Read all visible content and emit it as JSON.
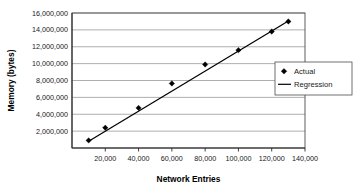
{
  "chart_data": {
    "type": "scatter",
    "title": "",
    "xlabel": "Network Entries",
    "ylabel": "Memory (bytes)",
    "xlim": [
      0,
      140000
    ],
    "ylim": [
      0,
      16000000
    ],
    "grid": true,
    "legend_position": "right-middle",
    "x_ticks": [
      {
        "value": 20000,
        "label": "20,000"
      },
      {
        "value": 40000,
        "label": "40,000"
      },
      {
        "value": 60000,
        "label": "60,000"
      },
      {
        "value": 80000,
        "label": "80,000"
      },
      {
        "value": 100000,
        "label": "100,000"
      },
      {
        "value": 120000,
        "label": "120,000"
      },
      {
        "value": 140000,
        "label": "140,000"
      }
    ],
    "y_ticks": [
      {
        "value": 2000000,
        "label": "2,000,000"
      },
      {
        "value": 4000000,
        "label": "4,000,000"
      },
      {
        "value": 6000000,
        "label": "6,000,000"
      },
      {
        "value": 8000000,
        "label": "8,000,000"
      },
      {
        "value": 10000000,
        "label": "10,000,000"
      },
      {
        "value": 12000000,
        "label": "12,000,000"
      },
      {
        "value": 14000000,
        "label": "14,000,000"
      },
      {
        "value": 16000000,
        "label": "16,000,000"
      }
    ],
    "series": [
      {
        "name": "Actual",
        "marker": "diamond",
        "style": "markers",
        "color": "#000000",
        "x": [
          10000,
          20000,
          40000,
          60000,
          80000,
          100000,
          120000,
          130000
        ],
        "values": [
          900000,
          2400000,
          4750000,
          7650000,
          9900000,
          11600000,
          13800000,
          15000000
        ]
      },
      {
        "name": "Regression",
        "marker": "none",
        "style": "line",
        "color": "#000000",
        "x": [
          10000,
          130000
        ],
        "values": [
          800000,
          15050000
        ]
      }
    ]
  },
  "legend": {
    "entries": [
      {
        "label": "Actual",
        "symbol": "diamond"
      },
      {
        "label": "Regression",
        "symbol": "line"
      }
    ]
  }
}
